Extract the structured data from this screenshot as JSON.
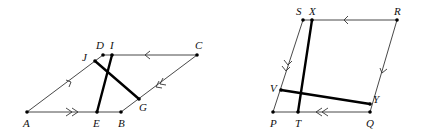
{
  "figures": [
    {
      "name": "parallelogram-ABCD",
      "labels": {
        "A": "A",
        "B": "B",
        "C": "C",
        "D": "D",
        "E": "E",
        "G": "G",
        "I": "I",
        "J": "J"
      }
    },
    {
      "name": "parallelogram-PQRS",
      "labels": {
        "P": "P",
        "Q": "Q",
        "R": "R",
        "S": "S",
        "T": "T",
        "V": "V",
        "X": "X",
        "Y": "Y"
      }
    }
  ],
  "colors": {
    "line": "#333333",
    "thick": "#000000",
    "text": "#111111"
  }
}
